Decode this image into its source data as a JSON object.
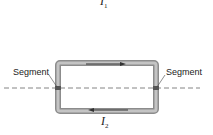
{
  "diagram": {
    "top_current": {
      "symbol": "I",
      "subscript": "1"
    },
    "bottom_current": {
      "symbol": "I",
      "subscript": "2"
    },
    "left_label": "Segment",
    "right_label": "Segment",
    "colors": {
      "wire_outer": "#8c8c8c",
      "wire_inner": "#c4c4c4",
      "arrow": "#333333",
      "dashed_line": "#666666",
      "segment_mark": "#555555"
    }
  }
}
